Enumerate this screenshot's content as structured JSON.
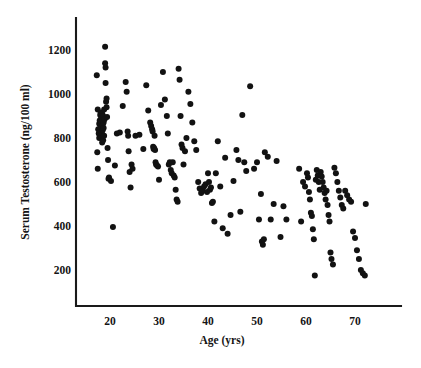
{
  "figure": {
    "kind": "scatter-plot",
    "background_color": "#ffffff",
    "ink_color": "#141414",
    "point_color": "#121212"
  },
  "chart_data": {
    "type": "scatter",
    "title": "",
    "subtitle": "",
    "xlabel": "Age (yrs)",
    "ylabel": "Serum Testosterone (ng/100 ml)",
    "xlim": [
      14,
      80
    ],
    "ylim": [
      100,
      1290
    ],
    "xticks": [
      20,
      30,
      40,
      50,
      60,
      70
    ],
    "xtick_labels": [
      "20",
      "30",
      "40",
      "50",
      "60",
      "70"
    ],
    "yticks": [
      200,
      400,
      600,
      800,
      1000,
      1200
    ],
    "ytick_labels": [
      "200",
      "400",
      "600",
      "800",
      "1000",
      "1200"
    ],
    "grid": false,
    "legend": null,
    "legend_position": "none",
    "marker": "filled-circle",
    "marker_size_px": 5.3,
    "annotations": [],
    "n_points": 186,
    "series": [
      {
        "name": "Serum testosterone by age",
        "x": [
          17.3,
          17.4,
          17.5,
          17.5,
          17.6,
          17.7,
          17.8,
          17.8,
          17.9,
          18.0,
          18.0,
          18.1,
          18.1,
          18.2,
          18.2,
          18.3,
          18.3,
          18.4,
          18.4,
          18.5,
          18.5,
          18.6,
          18.6,
          18.7,
          18.7,
          18.8,
          18.8,
          18.9,
          19.0,
          19.0,
          19.1,
          19.1,
          19.2,
          19.3,
          19.3,
          19.4,
          19.5,
          19.6,
          19.7,
          19.8,
          20.2,
          20.6,
          21.0,
          21.4,
          22.0,
          22.6,
          23.2,
          23.4,
          23.6,
          23.7,
          23.8,
          24.0,
          24.2,
          24.4,
          24.6,
          25.2,
          26.0,
          26.8,
          27.4,
          27.8,
          28.2,
          28.4,
          28.6,
          28.7,
          28.8,
          28.9,
          29.0,
          29.1,
          29.2,
          29.3,
          29.4,
          29.6,
          29.8,
          30.0,
          30.4,
          30.8,
          31.2,
          31.6,
          31.8,
          32.0,
          32.2,
          32.4,
          32.6,
          32.8,
          33.0,
          33.2,
          33.4,
          33.6,
          33.8,
          34.0,
          34.2,
          34.4,
          34.6,
          34.8,
          35.0,
          35.3,
          35.6,
          36.0,
          36.4,
          36.8,
          37.2,
          37.6,
          38.0,
          38.3,
          38.6,
          38.9,
          39.2,
          39.5,
          39.8,
          40.0,
          40.2,
          40.4,
          40.6,
          40.8,
          41.0,
          41.3,
          41.6,
          42.0,
          42.5,
          43.0,
          43.5,
          44.0,
          44.6,
          45.2,
          45.8,
          46.2,
          46.6,
          47.0,
          47.4,
          47.8,
          48.6,
          49.4,
          50.0,
          50.4,
          50.8,
          51.0,
          51.2,
          51.4,
          51.6,
          52.2,
          52.8,
          53.4,
          54.0,
          54.8,
          55.4,
          56.0,
          58.6,
          59.0,
          59.4,
          59.8,
          60.2,
          60.4,
          60.6,
          60.8,
          61.0,
          61.2,
          61.4,
          61.6,
          61.8,
          62.0,
          62.2,
          62.4,
          62.6,
          62.8,
          63.0,
          63.2,
          63.4,
          63.6,
          63.8,
          64.0,
          64.2,
          64.4,
          64.6,
          64.8,
          65.0,
          65.2,
          65.5,
          65.8,
          66.1,
          66.4,
          66.7,
          67.0,
          67.3,
          67.6,
          68.0,
          68.4,
          68.8,
          69.2,
          69.6,
          70.0,
          70.4,
          70.8,
          71.2,
          71.6,
          72.0,
          72.2
        ],
        "y": [
          1085,
          735,
          660,
          930,
          840,
          820,
          800,
          865,
          880,
          905,
          860,
          845,
          915,
          890,
          800,
          870,
          825,
          910,
          780,
          860,
          835,
          900,
          790,
          870,
          845,
          930,
          810,
          885,
          1215,
          1140,
          1120,
          1050,
          965,
          940,
          980,
          895,
          755,
          700,
          615,
          620,
          605,
          395,
          675,
          820,
          825,
          945,
          1055,
          1010,
          830,
          810,
          740,
          645,
          575,
          680,
          660,
          810,
          815,
          750,
          1040,
          925,
          870,
          855,
          840,
          830,
          760,
          750,
          755,
          810,
          745,
          690,
          680,
          675,
          670,
          610,
          950,
          1100,
          975,
          900,
          820,
          680,
          690,
          655,
          640,
          690,
          630,
          620,
          565,
          520,
          510,
          1115,
          1065,
          900,
          770,
          755,
          680,
          740,
          800,
          1010,
          955,
          870,
          785,
          745,
          600,
          570,
          550,
          560,
          580,
          590,
          555,
          640,
          600,
          565,
          575,
          505,
          510,
          420,
          640,
          785,
          580,
          390,
          710,
          365,
          450,
          605,
          745,
          700,
          465,
          905,
          690,
          650,
          1035,
          660,
          690,
          430,
          545,
          330,
          315,
          340,
          735,
          715,
          430,
          500,
          695,
          350,
          490,
          430,
          660,
          420,
          600,
          580,
          640,
          620,
          555,
          520,
          460,
          445,
          385,
          340,
          175,
          610,
          655,
          630,
          600,
          565,
          645,
          625,
          600,
          575,
          550,
          520,
          560,
          495,
          450,
          420,
          280,
          250,
          225,
          665,
          640,
          600,
          560,
          530,
          495,
          480,
          560,
          540,
          520,
          510,
          375,
          345,
          290,
          250,
          200,
          185,
          175,
          500
        ]
      }
    ]
  },
  "axes": {
    "x_axis_label": "Age (yrs)",
    "y_axis_label": "Serum Testosterone (ng/100 ml)",
    "x_tick_values": [
      "20",
      "30",
      "40",
      "50",
      "60",
      "70"
    ],
    "y_tick_values": [
      "1200",
      "1000",
      "800",
      "600",
      "400",
      "200"
    ]
  }
}
